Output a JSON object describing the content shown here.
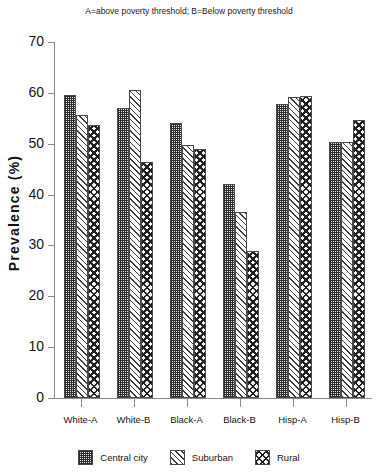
{
  "chart_data": {
    "type": "bar",
    "title": "A=above poverty threshold; B=Below poverty threshold",
    "xlabel": "",
    "ylabel": "Prevalence (%)",
    "ylim": [
      0,
      70
    ],
    "ytick_step": 10,
    "yticks": [
      70,
      60,
      50,
      40,
      30,
      20,
      10,
      0
    ],
    "grid": false,
    "legend_position": "bottom",
    "categories": [
      "White-A",
      "White-B",
      "Black-A",
      "Black-B",
      "Hisp-A",
      "Hisp-B"
    ],
    "series": [
      {
        "name": "Central city",
        "pattern": "dense-dotted-checker",
        "values": [
          59.6,
          57.0,
          54.0,
          42.0,
          57.8,
          50.3
        ]
      },
      {
        "name": "Suburban",
        "pattern": "diagonal-hatch",
        "values": [
          55.6,
          60.5,
          49.7,
          36.6,
          59.2,
          50.3
        ]
      },
      {
        "name": "Rural",
        "pattern": "crosshatch-diamond",
        "values": [
          53.7,
          46.4,
          49.0,
          29.0,
          59.4,
          54.7
        ]
      }
    ]
  },
  "colors": {
    "axis": "#8a8a8a",
    "text": "#151515",
    "bar_outline": "#4a4a4a",
    "background": "#ffffff"
  }
}
